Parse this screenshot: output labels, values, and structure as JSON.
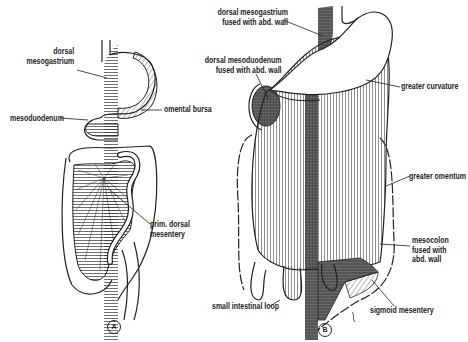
{
  "figure": {
    "panels": [
      {
        "id": "A",
        "badge": "A",
        "labels": {
          "dorsal_mesogastrium": [
            "dorsal",
            "mesogastrium"
          ],
          "mesoduodenum": "mesoduodenum",
          "omental_bursa": "omental bursa",
          "prim_dorsal_mesentery": [
            "prim. dorsal",
            "mesentery"
          ]
        }
      },
      {
        "id": "B",
        "badge": "B",
        "labels": {
          "dorsal_mesogastrium_fused": [
            "dorsal mesogastrium",
            "fused with abd. wall"
          ],
          "dorsal_mesoduodenum_fused": [
            "dorsal mesoduodenum",
            "fused with abd. wall"
          ],
          "greater_curvature": "greater curvature",
          "greater_omentum": "greater omentum",
          "mesocolon_fused": [
            "mesocolon",
            "fused with",
            "abd. wall"
          ],
          "small_intestinal_loop": "small intestinal loop",
          "sigmoid_mesentery": "sigmoid mesentery"
        }
      }
    ],
    "colors": {
      "ink": "#222222",
      "fused_wall": "#555555",
      "background": "#ffffff"
    }
  }
}
